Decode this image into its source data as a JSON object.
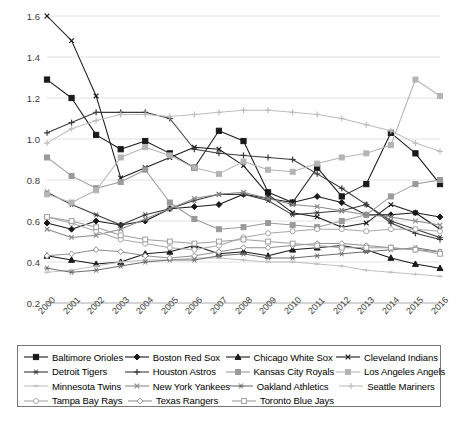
{
  "chart_data": {
    "type": "line",
    "title": "",
    "xlabel": "",
    "ylabel": "",
    "grid": true,
    "legend_position": "bottom",
    "ylim": [
      0.2,
      1.6
    ],
    "yticks": [
      "0.2",
      "0.4",
      "0.6",
      "0.8",
      "1.0",
      "1.2",
      "1.4",
      "1.6"
    ],
    "categories": [
      "2000",
      "2001",
      "2002",
      "2003",
      "2004",
      "2005",
      "2006",
      "2007",
      "2008",
      "2009",
      "2010",
      "2011",
      "2012",
      "2013",
      "2014",
      "2015",
      "2016"
    ],
    "series": [
      {
        "name": "Baltimore Orioles",
        "marker": "square-filled",
        "color": "#1a1a1a",
        "values": [
          1.29,
          1.2,
          1.02,
          0.95,
          0.99,
          0.93,
          0.86,
          1.04,
          0.99,
          0.74,
          0.69,
          0.86,
          0.72,
          0.78,
          1.03,
          0.93,
          0.78
        ]
      },
      {
        "name": "Boston Red Sox",
        "marker": "diamond-filled",
        "color": "#1a1a1a",
        "values": [
          0.59,
          0.56,
          0.6,
          0.58,
          0.6,
          0.66,
          0.67,
          0.68,
          0.73,
          0.71,
          0.69,
          0.72,
          0.69,
          0.63,
          0.63,
          0.64,
          0.62
        ]
      },
      {
        "name": "Chicago White Sox",
        "marker": "triangle-filled",
        "color": "#1a1a1a",
        "values": [
          0.43,
          0.41,
          0.39,
          0.4,
          0.44,
          0.45,
          0.48,
          0.44,
          0.45,
          0.43,
          0.46,
          0.47,
          0.48,
          0.46,
          0.42,
          0.39,
          0.37
        ]
      },
      {
        "name": "Cleveland Indians",
        "marker": "x",
        "color": "#1a1a1a",
        "values": [
          1.6,
          1.48,
          1.21,
          0.81,
          0.86,
          0.91,
          0.96,
          0.95,
          0.87,
          0.73,
          0.64,
          0.62,
          0.57,
          0.59,
          0.68,
          0.64,
          0.56
        ]
      },
      {
        "name": "Detroit Tigers",
        "marker": "asterisk",
        "color": "#3a3a3a",
        "values": [
          0.74,
          0.68,
          0.63,
          0.58,
          0.63,
          0.66,
          0.7,
          0.73,
          0.73,
          0.7,
          0.63,
          0.64,
          0.65,
          0.68,
          0.6,
          0.56,
          0.52
        ]
      },
      {
        "name": "Houston Astros",
        "marker": "plus",
        "color": "#3a3a3a",
        "values": [
          1.03,
          1.08,
          1.13,
          1.13,
          1.13,
          1.1,
          0.95,
          0.93,
          0.92,
          0.91,
          0.9,
          0.83,
          0.76,
          0.68,
          0.59,
          0.54,
          0.51
        ]
      },
      {
        "name": "Kansas City Royals",
        "marker": "square-gray",
        "color": "#9a9a9a",
        "values": [
          0.91,
          0.82,
          0.76,
          0.79,
          0.85,
          0.69,
          0.61,
          0.56,
          0.57,
          0.59,
          0.58,
          0.57,
          0.6,
          0.63,
          0.72,
          0.78,
          0.8
        ]
      },
      {
        "name": "Los Angeles Angels",
        "marker": "square-light",
        "color": "#b4b4b4",
        "values": [
          0.73,
          0.69,
          0.75,
          0.91,
          0.96,
          0.92,
          0.86,
          0.83,
          0.89,
          0.85,
          0.84,
          0.88,
          0.91,
          0.93,
          0.97,
          1.29,
          1.21
        ]
      },
      {
        "name": "Minnesota Twins",
        "marker": "dash-light",
        "color": "#c0c0c0",
        "values": [
          0.35,
          0.36,
          0.38,
          0.4,
          0.41,
          0.41,
          0.42,
          0.42,
          0.41,
          0.4,
          0.4,
          0.39,
          0.38,
          0.36,
          0.35,
          0.34,
          0.33
        ]
      },
      {
        "name": "New York Yankees",
        "marker": "x-gray",
        "color": "#8a8a8a",
        "values": [
          0.56,
          0.52,
          0.53,
          0.56,
          0.61,
          0.66,
          0.71,
          0.73,
          0.74,
          0.71,
          0.68,
          0.67,
          0.65,
          0.63,
          0.62,
          0.6,
          0.58
        ]
      },
      {
        "name": "Oakland Athletics",
        "marker": "asterisk-gray",
        "color": "#6e6e6e",
        "values": [
          0.37,
          0.35,
          0.36,
          0.38,
          0.4,
          0.41,
          0.41,
          0.43,
          0.44,
          0.42,
          0.42,
          0.43,
          0.44,
          0.45,
          0.46,
          0.47,
          0.45
        ]
      },
      {
        "name": "Seattle Mariners",
        "marker": "plus-light",
        "color": "#bdbdbd",
        "values": [
          0.98,
          1.05,
          1.09,
          1.12,
          1.12,
          1.11,
          1.12,
          1.13,
          1.14,
          1.14,
          1.13,
          1.12,
          1.1,
          1.07,
          1.04,
          0.98,
          0.94
        ]
      },
      {
        "name": "Tampa Bay Rays",
        "marker": "circle-open",
        "color": "#a8a8a8",
        "values": [
          0.62,
          0.59,
          0.55,
          0.51,
          0.49,
          0.47,
          0.46,
          0.48,
          0.52,
          0.54,
          0.55,
          0.56,
          0.56,
          0.55,
          0.56,
          0.56,
          0.55
        ]
      },
      {
        "name": "Texas Rangers",
        "marker": "diamond-open",
        "color": "#8f8f8f",
        "values": [
          0.43,
          0.44,
          0.46,
          0.45,
          0.43,
          0.42,
          0.43,
          0.45,
          0.47,
          0.47,
          0.48,
          0.49,
          0.49,
          0.48,
          0.47,
          0.46,
          0.45
        ]
      },
      {
        "name": "Toronto Blue Jays",
        "marker": "square-open",
        "color": "#9e9e9e",
        "values": [
          0.62,
          0.6,
          0.57,
          0.53,
          0.51,
          0.5,
          0.49,
          0.5,
          0.51,
          0.5,
          0.49,
          0.48,
          0.47,
          0.47,
          0.47,
          0.46,
          0.44
        ]
      }
    ]
  },
  "legend": {
    "rows": [
      [
        "Baltimore Orioles",
        "Boston Red Sox",
        "Chicago White Sox",
        "Cleveland Indians"
      ],
      [
        "Detroit Tigers",
        "Houston Astros",
        "Kansas City Royals",
        "Los Angeles Angels"
      ],
      [
        "Minnesota Twins",
        "New York Yankees",
        "Oakland Athletics",
        "Seattle Mariners"
      ],
      [
        "Tampa Bay Rays",
        "Texas Rangers",
        "Toronto Blue Jays"
      ]
    ]
  }
}
